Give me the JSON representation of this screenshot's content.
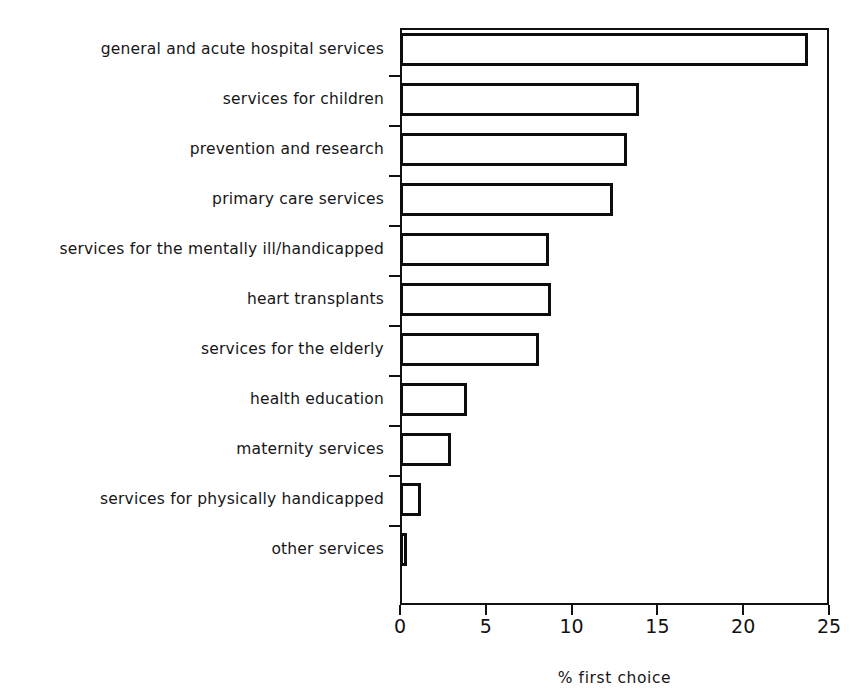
{
  "chart_data": {
    "type": "bar",
    "orientation": "horizontal",
    "title": "",
    "xlabel": "% first choice",
    "ylabel": "",
    "xlim": [
      0,
      25
    ],
    "ylim": null,
    "grid": false,
    "legend": null,
    "xticks": [
      "0",
      "5",
      "10",
      "15",
      "20",
      "25"
    ],
    "xtick_values": [
      0,
      5,
      10,
      15,
      20,
      25
    ],
    "categories": [
      "general and acute hospital services",
      "services for children",
      "prevention and research",
      "primary care services",
      "services for the mentally ill/handicapped",
      "heart transplants",
      "services for the elderly",
      "health education",
      "maternity services",
      "services for physically handicapped",
      "other services"
    ],
    "values": [
      23.8,
      13.9,
      13.2,
      12.4,
      8.7,
      8.8,
      8.1,
      3.9,
      3.0,
      1.2,
      0.4
    ],
    "series": [
      {
        "name": "% first choice",
        "values": [
          23.8,
          13.9,
          13.2,
          12.4,
          8.7,
          8.8,
          8.1,
          3.9,
          3.0,
          1.2,
          0.4
        ]
      }
    ],
    "bar_style": {
      "fill": "#ffffff",
      "edge": "#0d0d0d",
      "edge_width": 3
    },
    "axis_color": "#111111",
    "background": "#ffffff"
  }
}
